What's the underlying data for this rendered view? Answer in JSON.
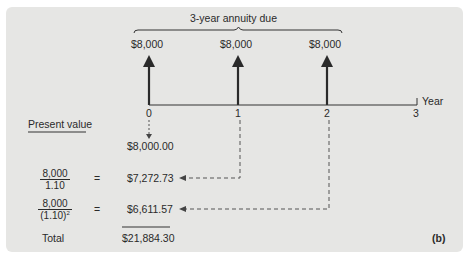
{
  "diagram": {
    "title": "3-year annuity due",
    "panel_label": "(b)",
    "axis_label": "Year",
    "ticks": [
      "0",
      "1",
      "2",
      "3"
    ],
    "cash_flows": [
      {
        "year": "0",
        "amount": "$8,000"
      },
      {
        "year": "1",
        "amount": "$8,000"
      },
      {
        "year": "2",
        "amount": "$8,000"
      }
    ],
    "present_value_header": "Present value",
    "rows": [
      {
        "numerator": "",
        "denominator": "",
        "equals": "",
        "value": "$8,000.00"
      },
      {
        "numerator": "8,000",
        "denominator": "1.10",
        "denominator_exp": "",
        "equals": "=",
        "value": "$7,272.73"
      },
      {
        "numerator": "8,000",
        "denominator": "(1.10)",
        "denominator_exp": "2",
        "equals": "=",
        "value": "$6,611.57"
      }
    ],
    "total_label": "Total",
    "total_value": "$21,884.30",
    "colors": {
      "panel_bg": "#e6e6e4",
      "ink": "#2a2a2a",
      "dashed": "#555555"
    }
  }
}
